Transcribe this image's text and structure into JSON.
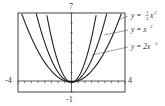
{
  "chart_data": {
    "type": "line",
    "title": "",
    "xlabel": "",
    "ylabel": "",
    "xlim": [
      -4,
      4
    ],
    "ylim": [
      -1,
      7
    ],
    "tick_labels": {
      "xmin": "-4",
      "xmax": "4",
      "ymin": "-1",
      "ymax": "7"
    },
    "grid": false,
    "series": [
      {
        "name": "y = ½x²",
        "coef": 0.5
      },
      {
        "name": "y = x²",
        "coef": 1
      },
      {
        "name": "y = 2x²",
        "coef": 2
      }
    ],
    "x": [
      -4,
      -3,
      -2,
      -1,
      0,
      1,
      2,
      3,
      4
    ]
  },
  "labels": {
    "ymax": "7",
    "ymin": "-1",
    "xmin": "-4",
    "xmax": "4",
    "eq1_pre": "y = ",
    "eq1_frac_num": "1",
    "eq1_frac_den": "2",
    "eq1_post": "x",
    "eq1_exp": "2",
    "eq2": "y = x",
    "eq2_exp": "2",
    "eq3": "y = 2x",
    "eq3_exp": "2"
  },
  "colors": {
    "curve": "#222222",
    "axis": "#333333",
    "frame": "#444444"
  }
}
